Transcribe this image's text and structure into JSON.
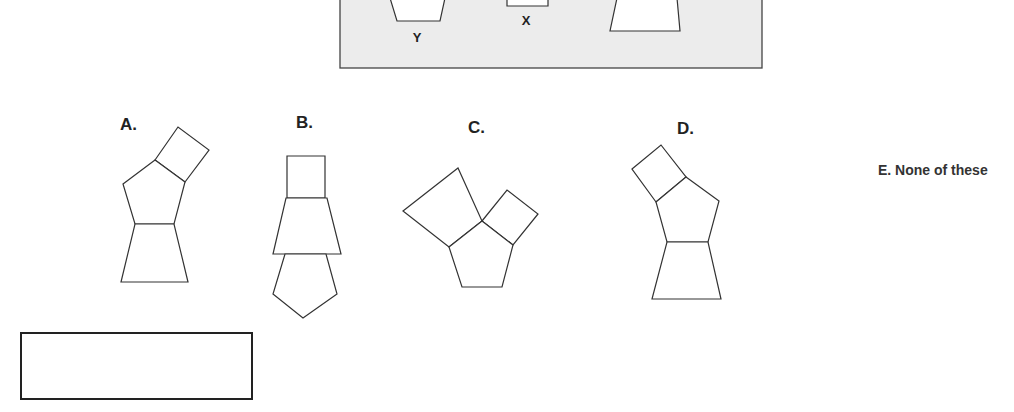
{
  "reference_panel": {
    "background": "#ececec",
    "labels": {
      "y": "Y",
      "x": "X"
    }
  },
  "options": {
    "a": "A.",
    "b": "B.",
    "c": "C.",
    "d": "D.",
    "e": "E. None of these"
  },
  "answer_box": {
    "value": ""
  }
}
